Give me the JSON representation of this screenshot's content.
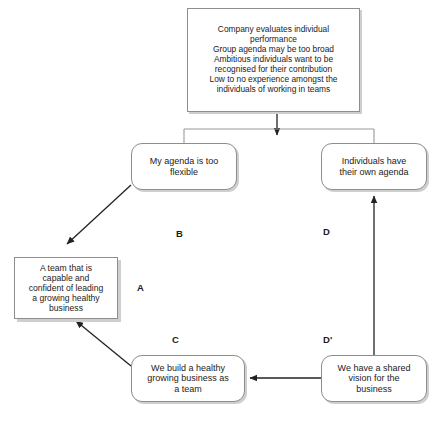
{
  "diagram": {
    "stroke_color": "#8d8d8d",
    "line_color": "#333333",
    "shadow_color": "#cfcfcf",
    "text_color": "#1b1b1b",
    "background": "#ffffff"
  },
  "nodes": {
    "conflict": {
      "id": "conflict",
      "shape": "rectangle",
      "text": "Company evaluates individual\nperformance\nGroup agenda may be too broad\nAmbitious individuals want to be\nrecognised for their contribution\nLow to no experience amongst the\nindividuals of working in teams"
    },
    "b": {
      "id": "B",
      "shape": "rounded-rectangle",
      "text": "My agenda is too\nflexible"
    },
    "d": {
      "id": "D",
      "shape": "rounded-rectangle",
      "text": "Individuals have\ntheir own agenda"
    },
    "a": {
      "id": "A",
      "shape": "rectangle",
      "text": "A team that is\ncapable and\nconfident of leading\na growing healthy\nbusiness"
    },
    "c": {
      "id": "C",
      "shape": "rounded-rectangle",
      "text": "We build a healthy\ngrowing business as\na team"
    },
    "dprime": {
      "id": "D'",
      "shape": "rounded-rectangle",
      "text": "We have a shared\nvision for the\nbusiness"
    }
  },
  "edge_labels": {
    "a": "A",
    "b": "B",
    "c": "C",
    "d": "D",
    "dprime": "D'"
  },
  "edges": [
    {
      "name": "conflict-to-b",
      "from": "conflict",
      "to": "b",
      "style": "solid",
      "arrow": "end"
    },
    {
      "name": "b-to-a",
      "from": "b",
      "to": "a",
      "style": "solid",
      "arrow": "end"
    },
    {
      "name": "a-to-c",
      "from": "a",
      "to": "c",
      "style": "solid",
      "arrow": "end"
    },
    {
      "name": "dprime-to-c",
      "from": "dprime",
      "to": "c",
      "style": "solid",
      "arrow": "end"
    },
    {
      "name": "dprime-to-d",
      "from": "dprime",
      "to": "d",
      "style": "solid",
      "arrow": "end"
    }
  ]
}
